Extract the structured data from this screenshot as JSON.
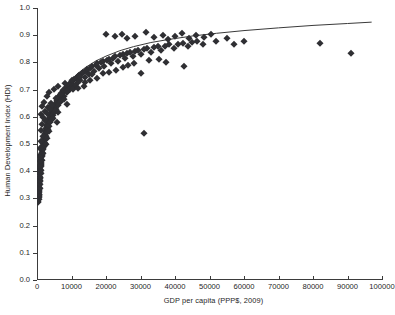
{
  "chart_data": {
    "type": "scatter",
    "title": "",
    "xlabel": "GDP per capita  (PPP$, 2009)",
    "ylabel": "Human Development Index (HDI)",
    "xlim": [
      0,
      100000
    ],
    "ylim": [
      0.0,
      1.0
    ],
    "xticks": [
      0,
      10000,
      20000,
      30000,
      40000,
      50000,
      60000,
      70000,
      80000,
      90000,
      100000
    ],
    "xtick_labels": [
      "0",
      "10000",
      "20000",
      "30000",
      "40000",
      "50000",
      "60000",
      "70000",
      "80000",
      "90000",
      "100000"
    ],
    "yticks": [
      0.0,
      0.1,
      0.2,
      0.3,
      0.4,
      0.5,
      0.6,
      0.7,
      0.8,
      0.9,
      1.0
    ],
    "ytick_labels": [
      "0.0",
      "0.1",
      "0.2",
      "0.3",
      "0.4",
      "0.5",
      "0.6",
      "0.7",
      "0.8",
      "0.9",
      "1.0"
    ],
    "grid": false,
    "legend": false,
    "marker": "diamond",
    "marker_color": "#2f2f33",
    "trendline": {
      "present": true,
      "color": "#3a3a3a",
      "shape": "logarithmic",
      "points": [
        [
          700,
          0.345
        ],
        [
          1000,
          0.395
        ],
        [
          1400,
          0.445
        ],
        [
          1900,
          0.492
        ],
        [
          2500,
          0.535
        ],
        [
          3200,
          0.573
        ],
        [
          4200,
          0.613
        ],
        [
          5500,
          0.652
        ],
        [
          7000,
          0.687
        ],
        [
          9000,
          0.722
        ],
        [
          11500,
          0.756
        ],
        [
          14000,
          0.781
        ],
        [
          17000,
          0.805
        ],
        [
          20000,
          0.823
        ],
        [
          24000,
          0.843
        ],
        [
          28000,
          0.858
        ],
        [
          33000,
          0.873
        ],
        [
          38000,
          0.884
        ],
        [
          45000,
          0.897
        ],
        [
          52000,
          0.907
        ],
        [
          60000,
          0.917
        ],
        [
          70000,
          0.927
        ],
        [
          80000,
          0.936
        ],
        [
          90000,
          0.943
        ],
        [
          97000,
          0.948
        ]
      ]
    },
    "points": [
      [
        350,
        0.285
      ],
      [
        400,
        0.292
      ],
      [
        420,
        0.3
      ],
      [
        450,
        0.305
      ],
      [
        470,
        0.312
      ],
      [
        500,
        0.298
      ],
      [
        520,
        0.318
      ],
      [
        540,
        0.325
      ],
      [
        560,
        0.308
      ],
      [
        580,
        0.33
      ],
      [
        600,
        0.336
      ],
      [
        620,
        0.318
      ],
      [
        650,
        0.342
      ],
      [
        660,
        0.35
      ],
      [
        680,
        0.328
      ],
      [
        700,
        0.356
      ],
      [
        720,
        0.362
      ],
      [
        740,
        0.34
      ],
      [
        760,
        0.368
      ],
      [
        780,
        0.375
      ],
      [
        800,
        0.352
      ],
      [
        820,
        0.38
      ],
      [
        850,
        0.388
      ],
      [
        870,
        0.365
      ],
      [
        900,
        0.395
      ],
      [
        920,
        0.402
      ],
      [
        950,
        0.378
      ],
      [
        980,
        0.408
      ],
      [
        1000,
        0.415
      ],
      [
        1020,
        0.392
      ],
      [
        1050,
        0.421
      ],
      [
        1080,
        0.428
      ],
      [
        1100,
        0.404
      ],
      [
        1150,
        0.434
      ],
      [
        1180,
        0.44
      ],
      [
        1200,
        0.418
      ],
      [
        1250,
        0.446
      ],
      [
        1280,
        0.452
      ],
      [
        1300,
        0.43
      ],
      [
        1350,
        0.458
      ],
      [
        1400,
        0.464
      ],
      [
        1430,
        0.442
      ],
      [
        1480,
        0.47
      ],
      [
        1500,
        0.478
      ],
      [
        1550,
        0.455
      ],
      [
        1600,
        0.484
      ],
      [
        1650,
        0.49
      ],
      [
        1700,
        0.468
      ],
      [
        1750,
        0.496
      ],
      [
        1800,
        0.502
      ],
      [
        1850,
        0.48
      ],
      [
        1900,
        0.508
      ],
      [
        1950,
        0.514
      ],
      [
        2000,
        0.492
      ],
      [
        2100,
        0.52
      ],
      [
        2150,
        0.527
      ],
      [
        2200,
        0.505
      ],
      [
        2300,
        0.533
      ],
      [
        2350,
        0.54
      ],
      [
        2400,
        0.518
      ],
      [
        2500,
        0.546
      ],
      [
        2600,
        0.552
      ],
      [
        2650,
        0.53
      ],
      [
        2750,
        0.558
      ],
      [
        2850,
        0.565
      ],
      [
        2900,
        0.543
      ],
      [
        3000,
        0.571
      ],
      [
        3100,
        0.577
      ],
      [
        3200,
        0.556
      ],
      [
        3300,
        0.583
      ],
      [
        3400,
        0.59
      ],
      [
        3500,
        0.568
      ],
      [
        3600,
        0.596
      ],
      [
        3750,
        0.602
      ],
      [
        3850,
        0.581
      ],
      [
        4000,
        0.608
      ],
      [
        4100,
        0.614
      ],
      [
        4250,
        0.593
      ],
      [
        4400,
        0.62
      ],
      [
        4500,
        0.627
      ],
      [
        4650,
        0.606
      ],
      [
        4800,
        0.633
      ],
      [
        4900,
        0.639
      ],
      [
        5050,
        0.618
      ],
      [
        5200,
        0.645
      ],
      [
        5400,
        0.651
      ],
      [
        5500,
        0.63
      ],
      [
        5700,
        0.657
      ],
      [
        5900,
        0.663
      ],
      [
        6000,
        0.643
      ],
      [
        6200,
        0.669
      ],
      [
        6400,
        0.675
      ],
      [
        6600,
        0.655
      ],
      [
        6800,
        0.681
      ],
      [
        7000,
        0.687
      ],
      [
        7200,
        0.667
      ],
      [
        7500,
        0.692
      ],
      [
        7700,
        0.698
      ],
      [
        7900,
        0.678
      ],
      [
        8200,
        0.704
      ],
      [
        8500,
        0.71
      ],
      [
        8700,
        0.69
      ],
      [
        9000,
        0.715
      ],
      [
        9300,
        0.721
      ],
      [
        9500,
        0.701
      ],
      [
        9800,
        0.726
      ],
      [
        10200,
        0.732
      ],
      [
        10500,
        0.712
      ],
      [
        10800,
        0.738
      ],
      [
        11200,
        0.743
      ],
      [
        11500,
        0.723
      ],
      [
        11900,
        0.749
      ],
      [
        12300,
        0.754
      ],
      [
        12600,
        0.735
      ],
      [
        13000,
        0.76
      ],
      [
        13400,
        0.765
      ],
      [
        13800,
        0.746
      ],
      [
        14200,
        0.77
      ],
      [
        14600,
        0.776
      ],
      [
        15000,
        0.757
      ],
      [
        15500,
        0.781
      ],
      [
        16000,
        0.786
      ],
      [
        16400,
        0.768
      ],
      [
        17000,
        0.791
      ],
      [
        17500,
        0.796
      ],
      [
        18000,
        0.778
      ],
      [
        18500,
        0.8
      ],
      [
        19000,
        0.805
      ],
      [
        19500,
        0.788
      ],
      [
        20200,
        0.809
      ],
      [
        20800,
        0.814
      ],
      [
        21400,
        0.797
      ],
      [
        22000,
        0.818
      ],
      [
        22700,
        0.822
      ],
      [
        23400,
        0.806
      ],
      [
        24000,
        0.826
      ],
      [
        24800,
        0.83
      ],
      [
        25500,
        0.815
      ],
      [
        26200,
        0.834
      ],
      [
        27000,
        0.838
      ],
      [
        27800,
        0.823
      ],
      [
        28500,
        0.841
      ],
      [
        29400,
        0.845
      ],
      [
        30200,
        0.831
      ],
      [
        31000,
        0.848
      ],
      [
        32000,
        0.852
      ],
      [
        33000,
        0.838
      ],
      [
        34000,
        0.855
      ],
      [
        35000,
        0.859
      ],
      [
        36000,
        0.845
      ],
      [
        37200,
        0.862
      ],
      [
        38400,
        0.866
      ],
      [
        39600,
        0.852
      ],
      [
        41000,
        0.869
      ],
      [
        42400,
        0.872
      ],
      [
        43800,
        0.859
      ],
      [
        45000,
        0.875
      ],
      [
        46500,
        0.878
      ],
      [
        48000,
        0.866
      ],
      [
        1300,
        0.612
      ],
      [
        1500,
        0.64
      ],
      [
        1700,
        0.598
      ],
      [
        2000,
        0.655
      ],
      [
        2400,
        0.62
      ],
      [
        2800,
        0.676
      ],
      [
        3200,
        0.636
      ],
      [
        3600,
        0.69
      ],
      [
        4200,
        0.652
      ],
      [
        4800,
        0.702
      ],
      [
        5400,
        0.668
      ],
      [
        6200,
        0.714
      ],
      [
        7000,
        0.684
      ],
      [
        8000,
        0.726
      ],
      [
        9000,
        0.7
      ],
      [
        10000,
        0.736
      ],
      [
        11000,
        0.714
      ],
      [
        12500,
        0.748
      ],
      [
        14000,
        0.727
      ],
      [
        16000,
        0.758
      ],
      [
        1100,
        0.552
      ],
      [
        1400,
        0.575
      ],
      [
        1800,
        0.53
      ],
      [
        2200,
        0.588
      ],
      [
        2600,
        0.5
      ],
      [
        3000,
        0.522
      ],
      [
        3400,
        0.546
      ],
      [
        800,
        0.46
      ],
      [
        950,
        0.486
      ],
      [
        1150,
        0.51
      ],
      [
        620,
        0.42
      ],
      [
        760,
        0.438
      ],
      [
        900,
        0.452
      ],
      [
        5200,
        0.62
      ],
      [
        6000,
        0.616
      ],
      [
        7400,
        0.7
      ],
      [
        8800,
        0.694
      ],
      [
        10400,
        0.702
      ],
      [
        12000,
        0.706
      ],
      [
        13500,
        0.712
      ],
      [
        15500,
        0.736
      ],
      [
        17500,
        0.742
      ],
      [
        19000,
        0.76
      ],
      [
        21000,
        0.764
      ],
      [
        23000,
        0.772
      ],
      [
        25000,
        0.784
      ],
      [
        26500,
        0.79
      ],
      [
        28000,
        0.796
      ],
      [
        30000,
        0.762
      ],
      [
        32500,
        0.808
      ],
      [
        35500,
        0.812
      ],
      [
        4600,
        0.596
      ],
      [
        5800,
        0.582
      ],
      [
        7800,
        0.664
      ],
      [
        8600,
        0.648
      ],
      [
        2900,
        0.614
      ],
      [
        3900,
        0.628
      ],
      [
        4400,
        0.642
      ],
      [
        20000,
        0.904
      ],
      [
        22500,
        0.898
      ],
      [
        24500,
        0.906
      ],
      [
        26000,
        0.888
      ],
      [
        28500,
        0.896
      ],
      [
        31500,
        0.91
      ],
      [
        34000,
        0.892
      ],
      [
        36500,
        0.902
      ],
      [
        38000,
        0.886
      ],
      [
        40000,
        0.898
      ],
      [
        42000,
        0.908
      ],
      [
        44000,
        0.89
      ],
      [
        46000,
        0.9
      ],
      [
        48500,
        0.893
      ],
      [
        50500,
        0.905
      ],
      [
        31000,
        0.54
      ],
      [
        37500,
        0.802
      ],
      [
        42500,
        0.785
      ],
      [
        55000,
        0.888
      ],
      [
        57000,
        0.868
      ],
      [
        82000,
        0.872
      ],
      [
        91000,
        0.833
      ],
      [
        52000,
        0.878
      ],
      [
        60000,
        0.88
      ]
    ]
  }
}
